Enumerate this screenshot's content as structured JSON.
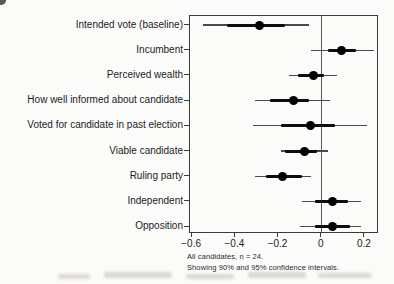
{
  "figure": {
    "background": "#fbfbfa",
    "artifacts": [
      "top-left-corner-scan-mark",
      "bottom-page-bleed-smudges"
    ]
  },
  "chart_data": {
    "type": "scatter",
    "variant": "dot-and-whisker coefficient plot, horizontal",
    "title": "",
    "xlabel": "",
    "ylabel": "",
    "grid": false,
    "legend_position": "none",
    "categories": [
      "Intended vote (baseline)",
      "Incumbent",
      "Perceived wealth",
      "How well informed about candidate",
      "Voted for candidate in past election",
      "Viable candidate",
      "Ruling party",
      "Independent",
      "Opposition"
    ],
    "estimates": [
      -0.29,
      0.09,
      -0.04,
      -0.13,
      -0.05,
      -0.08,
      -0.18,
      0.05,
      0.05
    ],
    "ci90": [
      [
        -0.44,
        -0.17
      ],
      [
        0.03,
        0.16
      ],
      [
        -0.11,
        0.01
      ],
      [
        -0.24,
        -0.06
      ],
      [
        -0.19,
        0.06
      ],
      [
        -0.17,
        -0.02
      ],
      [
        -0.26,
        -0.09
      ],
      [
        -0.03,
        0.12
      ],
      [
        -0.03,
        0.13
      ]
    ],
    "ci95": [
      [
        -0.55,
        -0.06
      ],
      [
        -0.05,
        0.24
      ],
      [
        -0.15,
        0.07
      ],
      [
        -0.31,
        0.04
      ],
      [
        -0.32,
        0.21
      ],
      [
        -0.19,
        0.03
      ],
      [
        -0.31,
        -0.05
      ],
      [
        -0.09,
        0.18
      ],
      [
        -0.1,
        0.18
      ]
    ],
    "x_ticks": [
      -0.6,
      -0.4,
      -0.2,
      0,
      0.2
    ],
    "x_tick_labels": [
      "−0.6",
      "−0.4",
      "−0.2",
      "0",
      "0.2"
    ],
    "xlim": [
      -0.61,
      0.265
    ],
    "reference_line_x": 0,
    "note_line1": "All candidates, n = 24.",
    "note_line2": "Showing 90% and 95% confidence intervals.",
    "colors": {
      "dot": "#000000",
      "ci_thin": "#4a4a4a",
      "ci_thick": "#0d0d0d",
      "box_border": "#3a3a3a",
      "reference_line": "#5a5a5a",
      "text": "#1c1c1c",
      "background": "#fbfbfa"
    }
  }
}
